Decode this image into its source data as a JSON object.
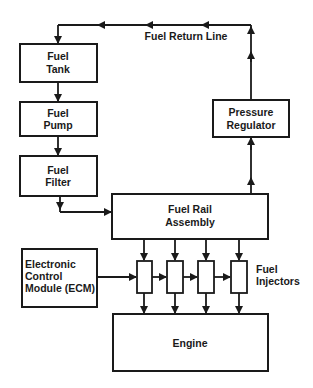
{
  "diagram": {
    "nodes": {
      "fuel_tank": {
        "line1": "Fuel",
        "line2": "Tank"
      },
      "fuel_pump": {
        "line1": "Fuel",
        "line2": "Pump"
      },
      "fuel_filter": {
        "line1": "Fuel",
        "line2": "Filter"
      },
      "fuel_rail": {
        "line1": "Fuel Rail",
        "line2": "Assembly"
      },
      "pressure_regulator": {
        "line1": "Pressure",
        "line2": "Regulator"
      },
      "ecm": {
        "line1": "Electronic",
        "line2": "Control",
        "line3": "Module (ECM)"
      },
      "engine": {
        "label": "Engine"
      },
      "injectors": {
        "line1": "Fuel",
        "line2": "Injectors",
        "count": 4
      }
    },
    "labels": {
      "return_line": "Fuel Return Line"
    },
    "edges": [
      {
        "from": "Fuel Tank",
        "to": "Fuel Pump"
      },
      {
        "from": "Fuel Pump",
        "to": "Fuel Filter"
      },
      {
        "from": "Fuel Filter",
        "to": "Fuel Rail Assembly"
      },
      {
        "from": "Fuel Rail Assembly",
        "to": "Pressure Regulator"
      },
      {
        "from": "Pressure Regulator",
        "to": "Fuel Tank",
        "label": "Fuel Return Line"
      },
      {
        "from": "Fuel Rail Assembly",
        "to": "Fuel Injectors"
      },
      {
        "from": "Electronic Control Module (ECM)",
        "to": "Fuel Injectors"
      },
      {
        "from": "Fuel Injectors",
        "to": "Engine"
      }
    ],
    "colors": {
      "stroke": "#1a1a1a",
      "background": "#ffffff"
    }
  }
}
